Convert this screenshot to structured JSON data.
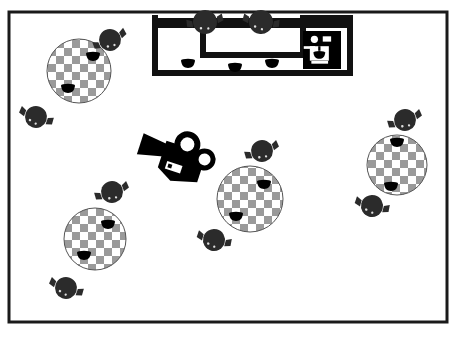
{
  "scene": {
    "kind": "cafe-floor-plan",
    "view": "top-down",
    "canvas": {
      "width": 459,
      "height": 338
    },
    "colors": {
      "background": "#ffffff",
      "wall": "#1a1a1a",
      "counter": "#111111",
      "chair": "#2b2b2b",
      "chair_outline": "#000000",
      "table_light": "#ffffff",
      "table_dark": "#9a9a9a",
      "table_outline": "#555555",
      "cup": "#000000",
      "equipment": "#000000"
    },
    "room": {
      "name": "room-outline",
      "x": 9,
      "y": 12,
      "width": 438,
      "height": 310,
      "stroke_width": 3
    },
    "counter": {
      "name": "service-counter",
      "stroke_width": 6,
      "outline_points": "155,18 155,73 350,73 350,18 303,18 303,55 203,55 203,18",
      "bar_top": {
        "x": 155,
        "y": 18,
        "width": 195,
        "height": 10
      }
    },
    "tables": [
      {
        "id": "table-1",
        "label": "Table 1",
        "cx": 79,
        "cy": 71,
        "r": 32,
        "cups": [
          {
            "x": 93,
            "y": 56
          },
          {
            "x": 68,
            "y": 88
          }
        ]
      },
      {
        "id": "table-2",
        "label": "Table 2",
        "cx": 250,
        "cy": 199,
        "r": 33,
        "cups": [
          {
            "x": 264,
            "y": 184
          },
          {
            "x": 236,
            "y": 216
          }
        ]
      },
      {
        "id": "table-3",
        "label": "Table 3",
        "cx": 95,
        "cy": 239,
        "r": 31,
        "cups": [
          {
            "x": 108,
            "y": 224
          },
          {
            "x": 84,
            "y": 255
          }
        ]
      },
      {
        "id": "table-4",
        "label": "Table 4",
        "cx": 397,
        "cy": 165,
        "r": 30,
        "cups": [
          {
            "x": 397,
            "y": 142
          },
          {
            "x": 391,
            "y": 186
          }
        ]
      }
    ],
    "chairs": [
      {
        "id": "chair-1",
        "cx": 110,
        "cy": 40,
        "r": 11,
        "rot": -25
      },
      {
        "id": "chair-2",
        "cx": 36,
        "cy": 117,
        "r": 11,
        "rot": 20
      },
      {
        "id": "chair-3",
        "cx": 205,
        "cy": 22,
        "r": 12,
        "rot": -10
      },
      {
        "id": "chair-4",
        "cx": 261,
        "cy": 22,
        "r": 12,
        "rot": 10
      },
      {
        "id": "chair-5",
        "cx": 262,
        "cy": 151,
        "r": 11,
        "rot": -20
      },
      {
        "id": "chair-6",
        "cx": 214,
        "cy": 240,
        "r": 11,
        "rot": 15
      },
      {
        "id": "chair-7",
        "cx": 112,
        "cy": 192,
        "r": 11,
        "rot": -20
      },
      {
        "id": "chair-8",
        "cx": 66,
        "cy": 288,
        "r": 11,
        "rot": 20
      },
      {
        "id": "chair-9",
        "cx": 405,
        "cy": 120,
        "r": 11,
        "rot": -20
      },
      {
        "id": "chair-10",
        "cx": 372,
        "cy": 206,
        "r": 11,
        "rot": 15
      }
    ],
    "counter_cups": [
      {
        "id": "counter-cup-1",
        "x": 188,
        "y": 63
      },
      {
        "id": "counter-cup-2",
        "x": 235,
        "y": 67
      },
      {
        "id": "counter-cup-3",
        "x": 272,
        "y": 63
      }
    ],
    "equipment": [
      {
        "id": "espresso-machine",
        "label": "Espresso machine",
        "icon": "espresso-machine-icon",
        "x": 303,
        "y": 31,
        "width": 38,
        "height": 38
      },
      {
        "id": "movie-camera",
        "label": "Movie camera",
        "icon": "movie-camera-icon",
        "x": 148,
        "y": 120,
        "width": 78,
        "height": 58,
        "rot": 18
      }
    ]
  }
}
